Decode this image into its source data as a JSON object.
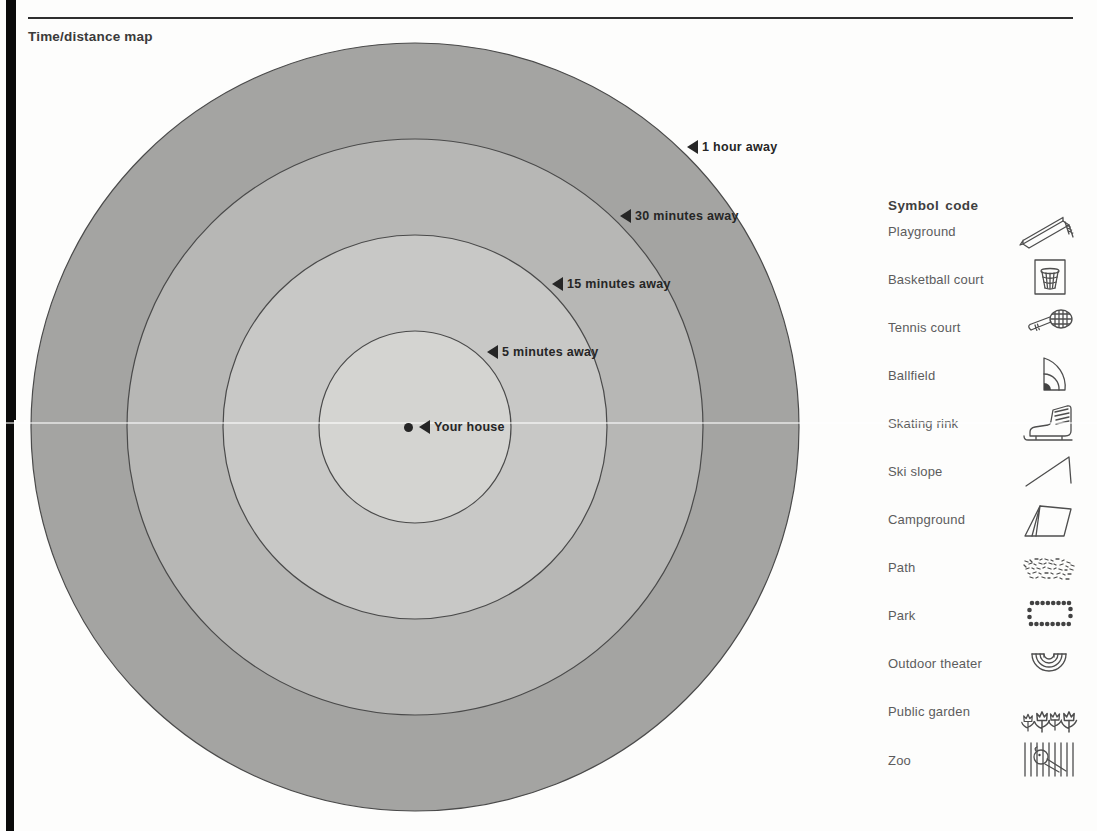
{
  "page": {
    "title": "Time/distance map"
  },
  "map": {
    "center_label": "Your house",
    "outline_color": "#4a4a4a",
    "rings": [
      {
        "label": "1 hour away",
        "radius_px": 384,
        "color": "#a4a4a2"
      },
      {
        "label": "30 minutes away",
        "radius_px": 288,
        "color": "#b7b7b5"
      },
      {
        "label": "15 minutes away",
        "radius_px": 192,
        "color": "#c8c8c6"
      },
      {
        "label": "5 minutes away",
        "radius_px": 96,
        "color": "#d4d4d1"
      }
    ]
  },
  "legend": {
    "heading": "Symbol code",
    "items": [
      {
        "label": "Playground",
        "icon": "playground-slide-icon"
      },
      {
        "label": "Basketball court",
        "icon": "basketball-hoop-icon"
      },
      {
        "label": "Tennis court",
        "icon": "tennis-racket-icon"
      },
      {
        "label": "Ballfield",
        "icon": "ballfield-icon"
      },
      {
        "label": "Skating rink",
        "icon": "ice-skate-icon"
      },
      {
        "label": "Ski slope",
        "icon": "ski-slope-icon"
      },
      {
        "label": "Campground",
        "icon": "tent-icon"
      },
      {
        "label": "Path",
        "icon": "path-texture-icon"
      },
      {
        "label": "Park",
        "icon": "dotted-rectangle-icon"
      },
      {
        "label": "Outdoor theater",
        "icon": "amphitheater-icon"
      },
      {
        "label": "Public garden",
        "icon": "tulips-icon"
      },
      {
        "label": "Zoo",
        "icon": "cage-bars-icon"
      }
    ]
  }
}
